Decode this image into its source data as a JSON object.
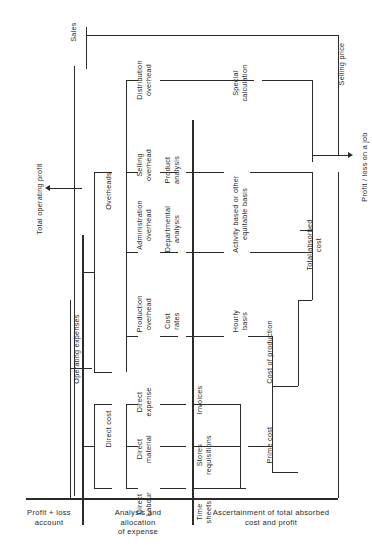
{
  "diagram": {
    "orientation": "labels rotated 90 degrees (read bottom-to-top)",
    "line_color": "#2b2b2b",
    "background": "#ffffff"
  },
  "inputs": {
    "sales": "Sales",
    "selling_price": "Selling price"
  },
  "outputs": {
    "total_operating_profit": "Total operating profit",
    "profit_loss_on_a_job": "Profit / loss on a job"
  },
  "expense_stream": {
    "operating_expenses": "Operating expenses",
    "overheads": "Overheads",
    "direct_cost": "Direct cost"
  },
  "overhead_items": [
    {
      "label": "Distribution\noverhead"
    },
    {
      "label": "Selling\noverhead"
    },
    {
      "label": "Administration\noverhead"
    },
    {
      "label": "Production\noverhead"
    }
  ],
  "direct_items": [
    {
      "label": "Direct\nexpense"
    },
    {
      "label": "Direct\nmaterial"
    },
    {
      "label": "Direct\nLabour"
    }
  ],
  "allocation_bases": [
    {
      "label": "Product\nanalysis"
    },
    {
      "label": "Departmental\nanalysis"
    },
    {
      "label": "Cost\nrates"
    },
    {
      "label": "Invoices"
    },
    {
      "label": "Stores\nrequisitions"
    },
    {
      "label": "Time\nsheets"
    }
  ],
  "absorption": {
    "special_calculation": "Special\ncalculation",
    "activity_basis": "Activity based or other\nequitable basis",
    "hourly_basis": "Hourly\nbasis",
    "prime_cost": "Prime cost",
    "cost_of_production": "Cost of production",
    "total_absorbed_cost": "Total absorbed\ncost"
  },
  "columns": [
    {
      "caption": "Profit + loss\naccount"
    },
    {
      "caption": "Analysis and\nallocation\nof expense"
    },
    {
      "caption": "Ascertainment of total absorbed\ncost and profit"
    }
  ]
}
